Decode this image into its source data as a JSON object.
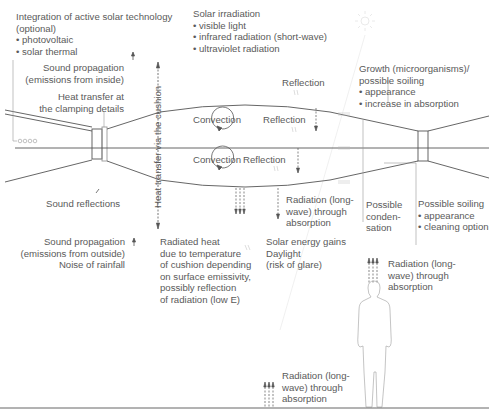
{
  "labels": {
    "active_solar": "Integration of active solar technology\n(optional)\n• photovoltaic\n• solar thermal",
    "solar_irradiation": "Solar irradiation\n• visible light\n• infrared radiation (short-wave)\n• ultraviolet radiation",
    "sound_inside": "Sound propagation\n(emissions from inside)",
    "heat_clamping": "Heat transfer at\nthe clamping details",
    "heat_cushion": "Heat transfer via the cushion",
    "reflection_top": "Reflection",
    "reflection_mid": "Reflection",
    "reflection_low": "Reflection",
    "convection_top": "Convection",
    "convection_low": "Convection",
    "growth": "Growth (microorganisms)/\npossible soiling\n• appearance\n• increase in absorption",
    "sound_reflections": "Sound reflections",
    "radiation_absorption_mid": "Radiation (long-\nwave) through\nabsorption",
    "condensation": "Possible\nconden-\nsation",
    "soiling": "Possible soiling\n• appearance\n• cleaning option",
    "sound_outside": "Sound propagation\n(emissions from outside)\nNoise of rainfall",
    "radiated_heat": "Radiated heat\ndue to temperature\nof cushion depending\non surface emissivity,\npossibly reflection\nof radiation (low E)",
    "solar_gains": "Solar energy gains\nDaylight\n(risk of glare)",
    "radiation_absorption_right": "Radiation (long-\nwave) through\nabsorption",
    "radiation_absorption_floor": "Radiation (long-\nwave) through\nabsorption"
  },
  "icons": {
    "sun": "sun-icon",
    "person": "person-silhouette",
    "solar_cells": "oooo"
  },
  "colors": {
    "line": "#555555",
    "text": "#5a5a5a",
    "faint": "#dddddd"
  }
}
